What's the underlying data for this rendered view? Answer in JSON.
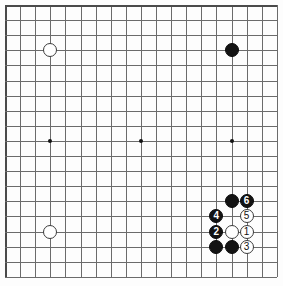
{
  "diagram": {
    "board_size": 19,
    "visible_columns": 19,
    "visible_rows": 19,
    "colors": {
      "background": "#ffffff",
      "board": "#fdfdfd",
      "grid_line": "#6b6b6b",
      "edge_line": "#4a4a4a",
      "black_stone": "#131313",
      "white_stone": "#ffffff",
      "star_point": "#141414",
      "black_label_text": "#ffffff",
      "white_label_text": "#111111"
    },
    "geometry": {
      "origin_x": 5,
      "origin_y": 5,
      "spacing": 15.1,
      "stone_diameter": 14,
      "star_diameter": 4
    }
  },
  "star_points": [
    {
      "name": "star-point-left",
      "col": 3,
      "row": 9
    },
    {
      "name": "star-point-center",
      "col": 9,
      "row": 9
    },
    {
      "name": "star-point-right",
      "col": 15,
      "row": 9
    }
  ],
  "stones": [
    {
      "name": "stone-white-upper-left",
      "color": "white",
      "col": 3,
      "row": 3,
      "label": ""
    },
    {
      "name": "stone-black-upper-right",
      "color": "black",
      "col": 15,
      "row": 3,
      "label": ""
    },
    {
      "name": "stone-white-lower-left",
      "color": "white",
      "col": 3,
      "row": 15,
      "label": ""
    },
    {
      "name": "stone-black-corner-upper",
      "color": "black",
      "col": 15,
      "row": 13,
      "label": ""
    },
    {
      "name": "stone-black-move-6",
      "color": "black",
      "col": 16,
      "row": 13,
      "label": "6"
    },
    {
      "name": "stone-white-move-5",
      "color": "white",
      "col": 16,
      "row": 14,
      "label": "5"
    },
    {
      "name": "stone-black-move-4",
      "color": "black",
      "col": 14,
      "row": 14,
      "label": "4"
    },
    {
      "name": "stone-black-move-2",
      "color": "black",
      "col": 14,
      "row": 15,
      "label": "2"
    },
    {
      "name": "stone-white-plain-center",
      "color": "white",
      "col": 15,
      "row": 15,
      "label": ""
    },
    {
      "name": "stone-white-move-1",
      "color": "white",
      "col": 16,
      "row": 15,
      "label": "1"
    },
    {
      "name": "stone-black-bottom-left",
      "color": "black",
      "col": 14,
      "row": 16,
      "label": ""
    },
    {
      "name": "stone-black-bottom-right",
      "color": "black",
      "col": 15,
      "row": 16,
      "label": ""
    },
    {
      "name": "stone-white-move-3",
      "color": "white",
      "col": 16,
      "row": 16,
      "label": "3"
    }
  ],
  "move_sequence": [
    {
      "number": "1",
      "color": "white"
    },
    {
      "number": "2",
      "color": "black"
    },
    {
      "number": "3",
      "color": "white"
    },
    {
      "number": "4",
      "color": "black"
    },
    {
      "number": "5",
      "color": "white"
    },
    {
      "number": "6",
      "color": "black"
    }
  ]
}
